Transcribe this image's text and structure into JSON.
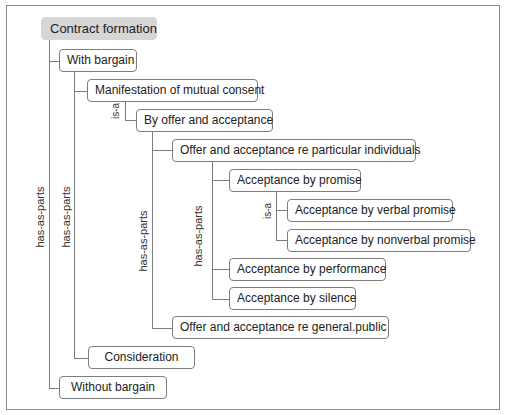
{
  "diagram": {
    "root": "Contract formation",
    "nodes": {
      "with_bargain": "With bargain",
      "manifestation": "Manifestation of mutual consent",
      "by_offer": "By offer and acceptance",
      "offer_particular": "Offer and acceptance re particular individuals",
      "acc_promise": "Acceptance by promise",
      "acc_verbal": "Acceptance by verbal promise",
      "acc_nonverbal": "Acceptance by nonverbal promise",
      "acc_performance": "Acceptance by performance",
      "acc_silence": "Acceptance by silence",
      "offer_public": "Offer and acceptance re general.public",
      "consideration": "Consideration",
      "without_bargain": "Without bargain"
    },
    "relations": {
      "root_rel": "has-as-parts",
      "with_bargain_rel": "has-as-parts",
      "manifestation_rel": "is-a",
      "by_offer_rel": "has-as-parts",
      "particular_rel": "has-as-parts",
      "promise_rel": "is-a"
    },
    "colors": {
      "root_fill": "#d6d6d6",
      "line": "#7d7d7d",
      "frame": "#8a8a8a"
    }
  }
}
